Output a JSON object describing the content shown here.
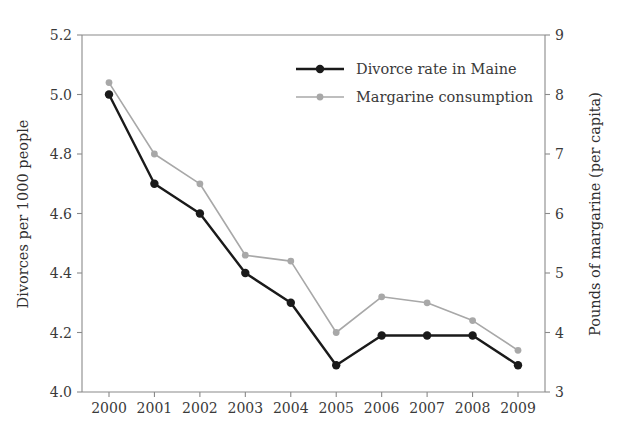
{
  "chart_data": {
    "type": "line",
    "title": "",
    "xlabel": "",
    "ylabel": "Divorces per 1000 people",
    "y2label": "Pounds of margarine (per capita)",
    "categories": [
      "2000",
      "2001",
      "2002",
      "2003",
      "2004",
      "2005",
      "2006",
      "2007",
      "2008",
      "2009"
    ],
    "x": [
      2000,
      2001,
      2002,
      2003,
      2004,
      2005,
      2006,
      2007,
      2008,
      2009
    ],
    "ylim": [
      4.0,
      5.2
    ],
    "y2lim": [
      3,
      9
    ],
    "yticks": [
      "4.0",
      "4.2",
      "4.4",
      "4.6",
      "4.8",
      "5.0",
      "5.2"
    ],
    "ytick_values": [
      4.0,
      4.2,
      4.4,
      4.6,
      4.8,
      5.0,
      5.2
    ],
    "y2ticks": [
      "3",
      "4",
      "5",
      "6",
      "7",
      "8",
      "9"
    ],
    "y2tick_values": [
      3,
      4,
      5,
      6,
      7,
      8,
      9
    ],
    "grid": false,
    "legend_position": "top-center",
    "series": [
      {
        "name": "Divorce rate in Maine",
        "axis": "left",
        "color": "#1a1a1a",
        "marker": "circle",
        "values": [
          5.0,
          4.7,
          4.6,
          4.4,
          4.3,
          4.09,
          4.19,
          4.19,
          4.19,
          4.09
        ]
      },
      {
        "name": "Margarine consumption",
        "axis": "right",
        "color": "#a8a8a8",
        "marker": "circle",
        "values": [
          8.2,
          7.0,
          6.5,
          5.3,
          5.2,
          4.0,
          4.6,
          4.5,
          4.2,
          3.7
        ]
      }
    ]
  },
  "axes": {
    "left_title": "Divorces per 1000 people",
    "right_title": "Pounds of margarine (per capita)"
  },
  "legend": {
    "items": [
      {
        "label": "Divorce rate in Maine",
        "color": "#1a1a1a"
      },
      {
        "label": "Margarine consumption",
        "color": "#a8a8a8"
      }
    ]
  }
}
